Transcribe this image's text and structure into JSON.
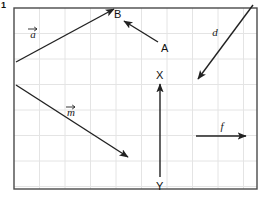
{
  "figure": {
    "problem_number": "1",
    "panel": {
      "border_color": "#4a4a4a",
      "grid_color": "#e4e4e4",
      "background_color": "#ffffff",
      "x": 14,
      "y": 8,
      "width": 243,
      "height": 181,
      "grid_spacing": 25.5
    },
    "vector_color": "#222222",
    "vectors": [
      {
        "id": "a",
        "label": "a",
        "has_overbar": true,
        "label_x": 33,
        "label_y": 38,
        "x1": 16,
        "y1": 62,
        "x2": 114,
        "y2": 9,
        "direction": "up-right"
      },
      {
        "id": "AB",
        "label": "",
        "has_overbar": false,
        "label_x": 0,
        "label_y": 0,
        "x1": 158,
        "y1": 42,
        "x2": 124,
        "y2": 21,
        "direction": "up-left"
      },
      {
        "id": "d",
        "label": "d",
        "has_overbar": false,
        "label_x": 215,
        "label_y": 36,
        "x1": 253,
        "y1": 5,
        "x2": 198,
        "y2": 79,
        "direction": "down-left"
      },
      {
        "id": "XY",
        "label": "",
        "has_overbar": false,
        "label_x": 0,
        "label_y": 0,
        "x1": 160,
        "y1": 177,
        "x2": 160,
        "y2": 84,
        "direction": "up"
      },
      {
        "id": "m",
        "label": "m",
        "has_overbar": true,
        "label_x": 71,
        "label_y": 116,
        "x1": 16,
        "y1": 85,
        "x2": 128,
        "y2": 157,
        "direction": "down-right"
      },
      {
        "id": "f",
        "label": "f",
        "has_overbar": false,
        "label_x": 222,
        "label_y": 130,
        "x1": 196,
        "y1": 136,
        "x2": 246,
        "y2": 136,
        "direction": "right"
      }
    ],
    "point_labels": [
      {
        "id": "B",
        "text": "B",
        "x": 114,
        "y": 18
      },
      {
        "id": "A",
        "text": "A",
        "x": 161,
        "y": 52
      },
      {
        "id": "X",
        "text": "X",
        "x": 156,
        "y": 79
      },
      {
        "id": "Y",
        "text": "Y",
        "x": 156,
        "y": 190
      }
    ]
  }
}
